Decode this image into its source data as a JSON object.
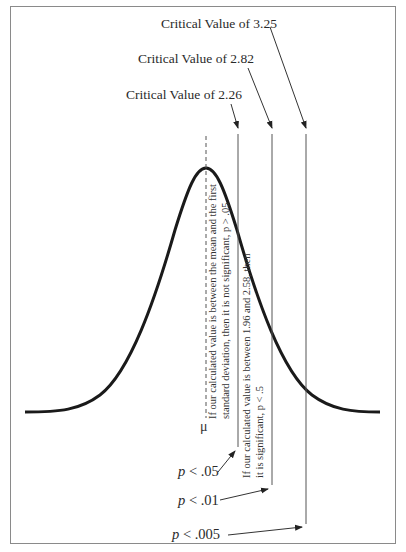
{
  "diagram": {
    "type": "normal-distribution-critical-values",
    "critical_labels": [
      {
        "text": "Critical Value of 3.25",
        "value": 3.25
      },
      {
        "text": "Critical Value of 2.82",
        "value": 2.82
      },
      {
        "text": "Critical Value of 2.26",
        "value": 2.26
      }
    ],
    "mean_symbol": "μ",
    "region_notes": {
      "not_significant_line1": "If our calculated value is between the mean and the first",
      "not_significant_line2": "standard deviation, then it is not significant, p > .05",
      "significant_line1": "If our calculated value is between 1.96 and 2.58, then",
      "significant_line2": "it is significant, p < .5"
    },
    "p_labels": [
      {
        "p": "p",
        "rest": " < .05"
      },
      {
        "p": "p",
        "rest": " < .01"
      },
      {
        "p": "p",
        "rest": " < .005"
      }
    ],
    "colors": {
      "curve": "#1a1a1a",
      "lines": "#555555",
      "frame": "#8a8a8a"
    }
  }
}
